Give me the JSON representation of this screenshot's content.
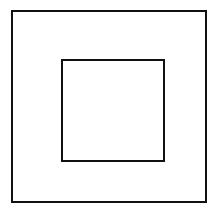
{
  "figure": {
    "canvas": {
      "width": 219,
      "height": 212,
      "background_color": "#ffffff"
    },
    "shapes": [
      {
        "name": "outer-square",
        "type": "square",
        "x": 12,
        "y": 11,
        "width": 194,
        "height": 191,
        "stroke_color": "#111111",
        "stroke_width": 2,
        "fill": "none"
      },
      {
        "name": "inner-square",
        "type": "square",
        "x": 62,
        "y": 60,
        "width": 102,
        "height": 101,
        "stroke_color": "#111111",
        "stroke_width": 2,
        "fill": "none"
      }
    ]
  }
}
